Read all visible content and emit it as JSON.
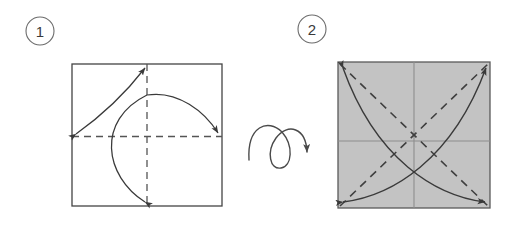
{
  "diagram": {
    "type": "origami-step-diagram",
    "steps": [
      {
        "number": "1",
        "label_position": {
          "cx": 40,
          "cy": 31,
          "r": 14
        },
        "paper": {
          "fill": "#ffffff",
          "stroke": "#444444",
          "x": 72,
          "y": 64,
          "width": 150,
          "height": 142
        },
        "crease_lines": [
          {
            "name": "vertical-center-crease",
            "style": "dashed",
            "x1": 147,
            "y1": 64,
            "x2": 147,
            "y2": 206
          },
          {
            "name": "horizontal-center-crease",
            "style": "dashed",
            "x1": 72,
            "y1": 136,
            "x2": 222,
            "y2": 136
          }
        ],
        "fold_arrows": [
          {
            "name": "fold-arrow-left-to-top",
            "double_headed": true,
            "from": "left-mid-edge",
            "to": "top-center"
          },
          {
            "name": "fold-arrow-bottom-to-right",
            "double_headed": true,
            "from": "bottom-center",
            "to": "right-mid-edge"
          }
        ]
      },
      {
        "number": "2",
        "label_position": {
          "cx": 312,
          "cy": 29,
          "r": 14
        },
        "paper": {
          "fill": "#c3c3c3",
          "stroke": "#5a5a5a",
          "x": 338,
          "y": 62,
          "width": 152,
          "height": 146
        },
        "crease_lines": [
          {
            "name": "vertical-center-crease",
            "style": "solid",
            "x1": 414,
            "y1": 62,
            "x2": 414,
            "y2": 208
          },
          {
            "name": "horizontal-center-crease",
            "style": "solid",
            "x1": 338,
            "y1": 141,
            "x2": 490,
            "y2": 141
          },
          {
            "name": "diagonal-crease-tlbr",
            "style": "dashed",
            "x1": 338,
            "y1": 62,
            "x2": 490,
            "y2": 208
          },
          {
            "name": "diagonal-crease-bltr",
            "style": "dashed",
            "x1": 338,
            "y1": 208,
            "x2": 490,
            "y2": 62
          }
        ],
        "fold_arrows": [
          {
            "name": "fold-arrow-diagonal-bl-to-tr",
            "double_headed": true,
            "from": "bottom-left-corner",
            "to": "top-right-corner"
          },
          {
            "name": "fold-arrow-diagonal-tl-to-br",
            "double_headed": true,
            "from": "top-left-corner",
            "to": "bottom-right-corner"
          }
        ]
      }
    ],
    "transition": {
      "name": "turn-over-symbol",
      "meaning": "turn the paper over",
      "arrow_direction": "down-right"
    },
    "colors": {
      "paper_fill_step1": "#ffffff",
      "paper_fill_step2": "#c3c3c3",
      "outline": "#444444",
      "crease_dashed": "#555555",
      "arrow": "#3a3a3a",
      "step_circle_stroke": "#6b6b6b",
      "step_number_text": "#3a3a3a",
      "background": "#ffffff"
    }
  }
}
